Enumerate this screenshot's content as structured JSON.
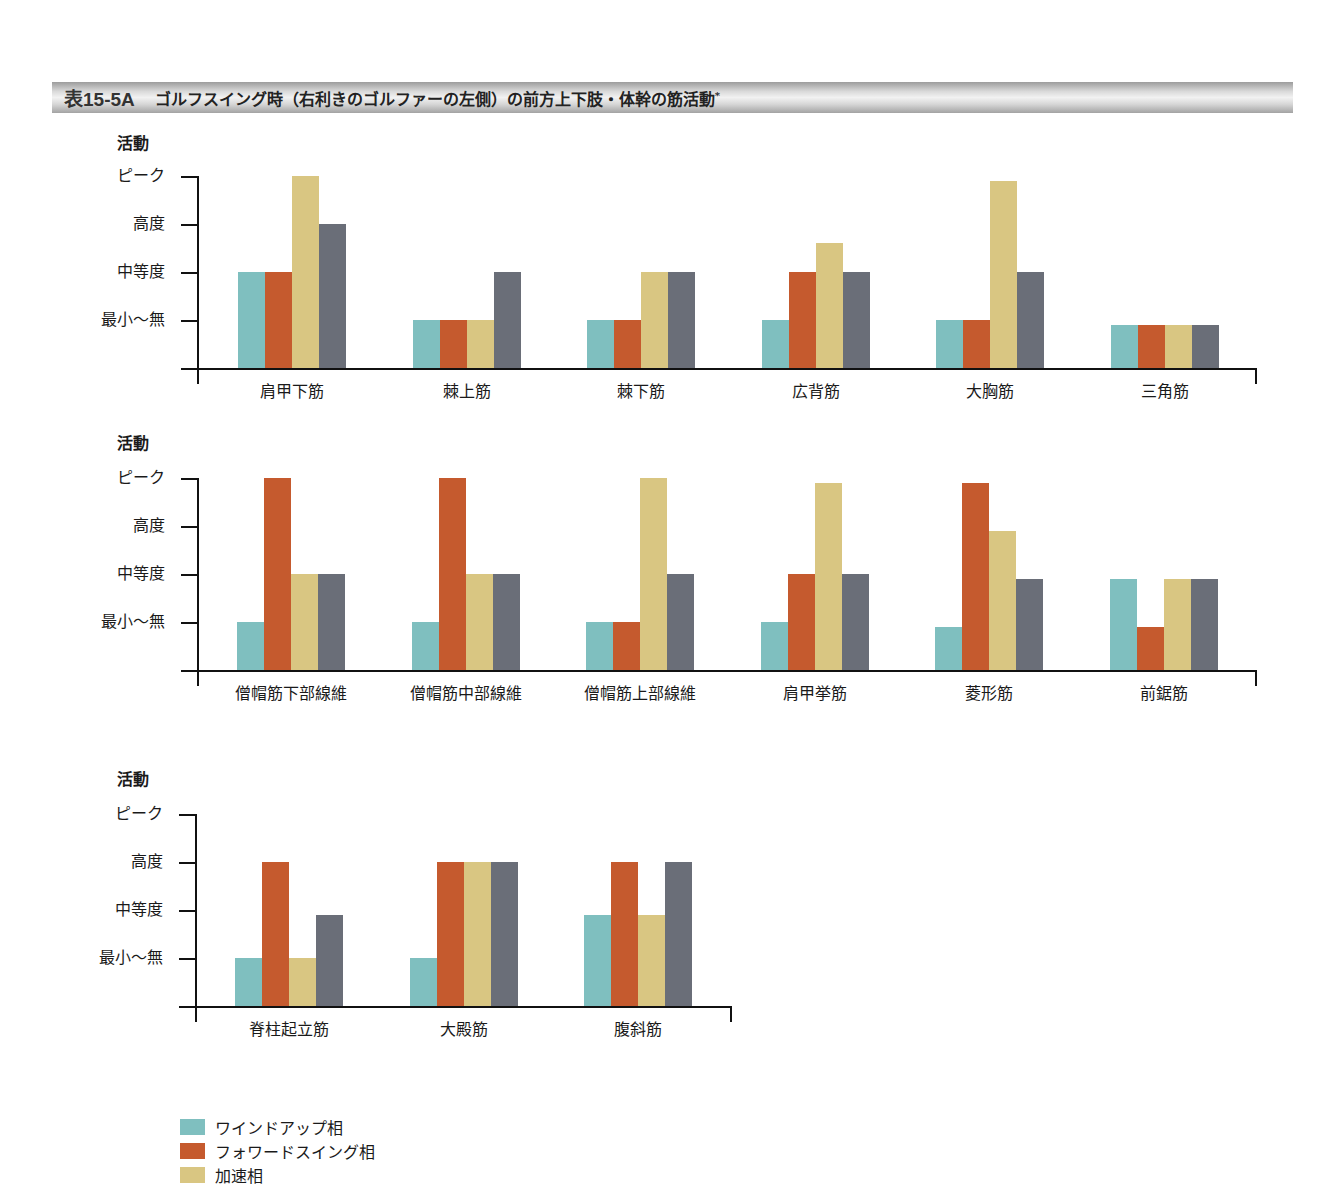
{
  "title": {
    "number": "表15-5A",
    "text": "ゴルフスイング時（右利きのゴルファーの左側）の前方上下肢・体幹の筋活動",
    "footnote_mark": "*"
  },
  "colors": {
    "windup": "#7fbfbf",
    "forward_swing": "#c55a2e",
    "acceleration": "#d9c682",
    "follow_through": "#6a6e78"
  },
  "legend": [
    {
      "label": "ワインドアップ相",
      "color_key": "windup"
    },
    {
      "label": "フォワードスイング相",
      "color_key": "forward_swing"
    },
    {
      "label": "加速相",
      "color_key": "acceleration"
    }
  ],
  "y_axis": {
    "title": "活動",
    "ticks": [
      "最小〜無",
      "中等度",
      "高度",
      "ピーク"
    ]
  },
  "chart_data": [
    {
      "type": "bar",
      "title": "",
      "ylabel": "活動",
      "yticks": [
        "最小〜無",
        "中等度",
        "高度",
        "ピーク"
      ],
      "ylim": [
        0,
        4
      ],
      "categories": [
        "肩甲下筋",
        "棘上筋",
        "棘下筋",
        "広背筋",
        "大胸筋",
        "三角筋"
      ],
      "series": [
        {
          "name": "ワインドアップ相",
          "values": [
            2,
            1,
            1,
            1,
            1,
            0.9
          ]
        },
        {
          "name": "フォワードスイング相",
          "values": [
            2,
            1,
            1,
            2,
            1,
            0.9
          ]
        },
        {
          "name": "加速相",
          "values": [
            4,
            1,
            2,
            2.6,
            3.9,
            0.9
          ]
        },
        {
          "name": "(4th phase, legend cut off)",
          "values": [
            3,
            2,
            2,
            2,
            2,
            0.9
          ]
        }
      ]
    },
    {
      "type": "bar",
      "title": "",
      "ylabel": "活動",
      "yticks": [
        "最小〜無",
        "中等度",
        "高度",
        "ピーク"
      ],
      "ylim": [
        0,
        4
      ],
      "categories": [
        "僧帽筋下部線維",
        "僧帽筋中部線維",
        "僧帽筋上部線維",
        "肩甲挙筋",
        "菱形筋",
        "前鋸筋"
      ],
      "series": [
        {
          "name": "ワインドアップ相",
          "values": [
            1,
            1,
            1,
            1,
            0.9,
            1.9
          ]
        },
        {
          "name": "フォワードスイング相",
          "values": [
            4,
            4,
            1,
            2,
            3.9,
            0.9
          ]
        },
        {
          "name": "加速相",
          "values": [
            2,
            2,
            4,
            3.9,
            2.9,
            1.9
          ]
        },
        {
          "name": "(4th phase, legend cut off)",
          "values": [
            2,
            2,
            2,
            2,
            1.9,
            1.9
          ]
        }
      ]
    },
    {
      "type": "bar",
      "title": "",
      "ylabel": "活動",
      "yticks": [
        "最小〜無",
        "中等度",
        "高度",
        "ピーク"
      ],
      "ylim": [
        0,
        4
      ],
      "categories": [
        "脊柱起立筋",
        "大殿筋",
        "腹斜筋"
      ],
      "series": [
        {
          "name": "ワインドアップ相",
          "values": [
            1,
            1,
            1.9
          ]
        },
        {
          "name": "フォワードスイング相",
          "values": [
            3,
            3,
            3
          ]
        },
        {
          "name": "加速相",
          "values": [
            1,
            3,
            1.9
          ]
        },
        {
          "name": "(4th phase, legend cut off)",
          "values": [
            1.9,
            3,
            3
          ]
        }
      ]
    }
  ]
}
